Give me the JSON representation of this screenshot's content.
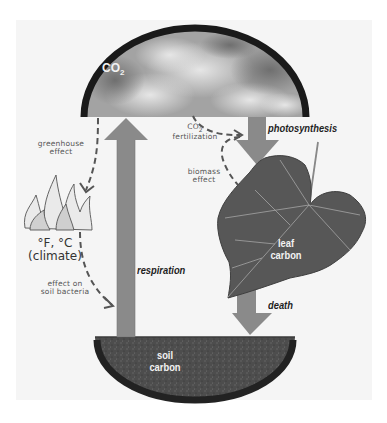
{
  "diagram": {
    "type": "carbon-cycle",
    "pools": {
      "atmosphere": {
        "label": "CO",
        "subscript": "2"
      },
      "leaf": {
        "label_line1": "leaf",
        "label_line2": "carbon"
      },
      "soil": {
        "label_line1": "soil",
        "label_line2": "carbon"
      },
      "climate": {
        "label_line1": "°F, °C",
        "label_line2": "(climate)"
      }
    },
    "processes": {
      "photosynthesis": "photosynthesis",
      "respiration": "respiration",
      "death": "death"
    },
    "feedbacks": {
      "co2_fertilization": {
        "line1_main": "CO",
        "line1_sub": "2",
        "line2": "fertilization"
      },
      "biomass_effect": {
        "line1": "biomass",
        "line2": "effect"
      },
      "greenhouse_effect": {
        "line1": "greenhouse",
        "line2": "effect"
      },
      "soil_bacteria": {
        "line1": "effect on",
        "line2": "soil bacteria"
      }
    },
    "colors": {
      "arrow": "#8a8a8a",
      "ring": "#1a1a1a",
      "sky": "#9a9a9a",
      "soil": "#4a4a4a",
      "leaf": "#555555",
      "background": "#f5f5f5"
    }
  }
}
